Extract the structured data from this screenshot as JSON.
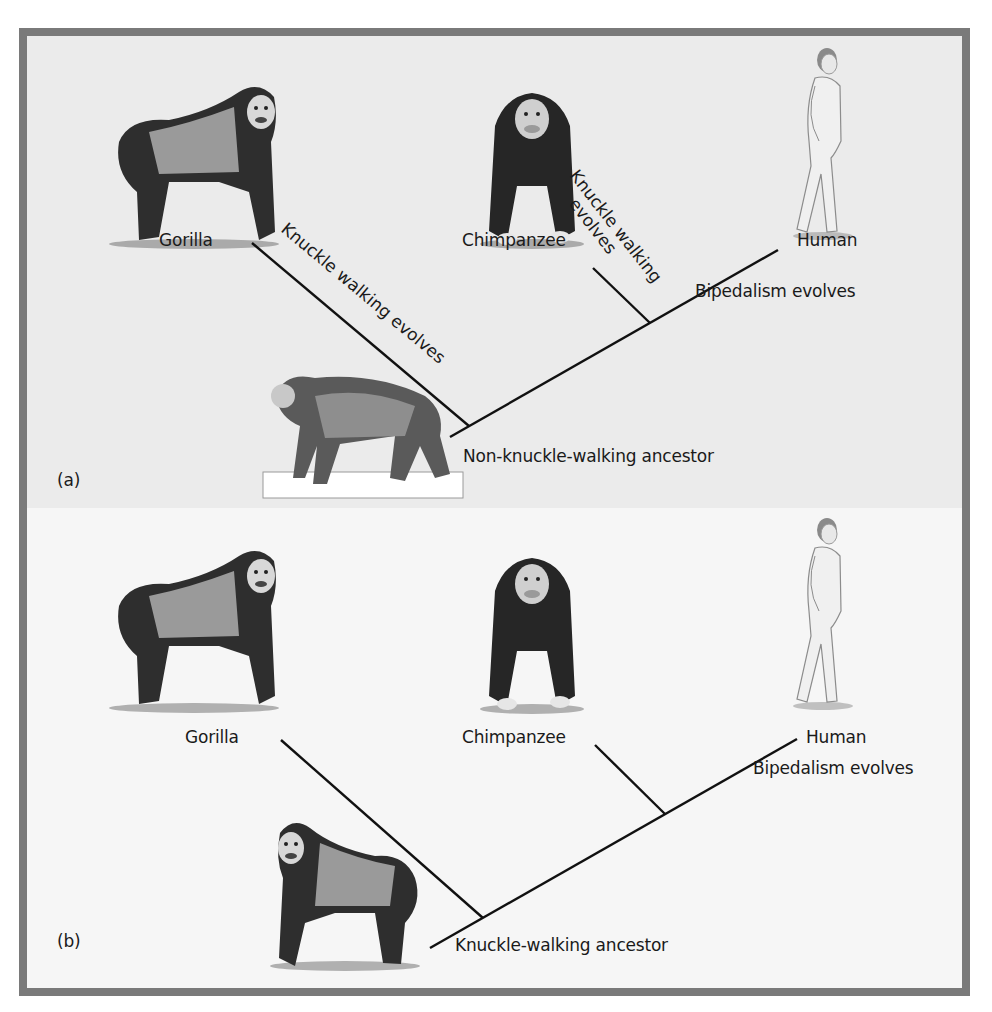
{
  "figure": {
    "frame_color": "#7a7a7a",
    "panel_a_bg": "#ebebeb",
    "panel_b_bg": "#f6f6f6"
  },
  "panel_a": {
    "tag": "(a)",
    "taxa": {
      "gorilla": "Gorilla",
      "chimpanzee": "Chimpanzee",
      "human": "Human"
    },
    "events": {
      "gorilla_branch": "Knuckle walking evolves",
      "chimp_branch_line1": "Knuckle walking",
      "chimp_branch_line2": "evolves",
      "human_branch": "Bipedalism evolves"
    },
    "ancestor": "Non-knuckle-walking ancestor",
    "illustrations": [
      "gorilla-illustration",
      "chimpanzee-illustration",
      "human-illustration",
      "monkey-ancestor-illustration"
    ]
  },
  "panel_b": {
    "tag": "(b)",
    "taxa": {
      "gorilla": "Gorilla",
      "chimpanzee": "Chimpanzee",
      "human": "Human"
    },
    "events": {
      "human_branch": "Bipedalism evolves"
    },
    "ancestor": "Knuckle-walking ancestor",
    "illustrations": [
      "gorilla-illustration",
      "chimpanzee-illustration",
      "human-illustration",
      "gorilla-ancestor-illustration"
    ]
  }
}
